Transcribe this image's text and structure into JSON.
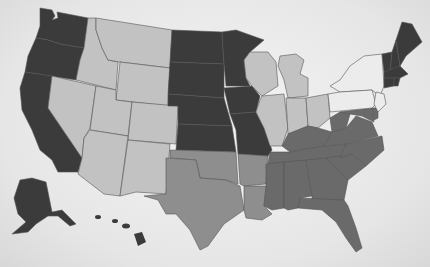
{
  "map": {
    "title": "United States map",
    "legend_colors": {
      "dark": "#3b3b3b",
      "light": "#c2c2c2",
      "medium": "#8e8e8e",
      "southeast": "#6a6a6a",
      "pale": "#ececec"
    },
    "states": [
      {
        "name": "Washington",
        "shade": "dark"
      },
      {
        "name": "Oregon",
        "shade": "dark"
      },
      {
        "name": "California",
        "shade": "dark"
      },
      {
        "name": "Idaho",
        "shade": "light"
      },
      {
        "name": "Nevada",
        "shade": "light"
      },
      {
        "name": "Montana",
        "shade": "light"
      },
      {
        "name": "Wyoming",
        "shade": "light"
      },
      {
        "name": "Utah",
        "shade": "light"
      },
      {
        "name": "Colorado",
        "shade": "light"
      },
      {
        "name": "Arizona",
        "shade": "light"
      },
      {
        "name": "New Mexico",
        "shade": "light"
      },
      {
        "name": "North Dakota",
        "shade": "dark"
      },
      {
        "name": "South Dakota",
        "shade": "dark"
      },
      {
        "name": "Nebraska",
        "shade": "dark"
      },
      {
        "name": "Kansas",
        "shade": "dark"
      },
      {
        "name": "Minnesota",
        "shade": "dark"
      },
      {
        "name": "Iowa",
        "shade": "dark"
      },
      {
        "name": "Missouri",
        "shade": "dark"
      },
      {
        "name": "Oklahoma",
        "shade": "medium"
      },
      {
        "name": "Texas",
        "shade": "medium"
      },
      {
        "name": "Arkansas",
        "shade": "medium"
      },
      {
        "name": "Louisiana",
        "shade": "medium"
      },
      {
        "name": "Wisconsin",
        "shade": "light"
      },
      {
        "name": "Michigan",
        "shade": "light"
      },
      {
        "name": "Illinois",
        "shade": "light"
      },
      {
        "name": "Indiana",
        "shade": "light"
      },
      {
        "name": "Ohio",
        "shade": "light"
      },
      {
        "name": "Kentucky",
        "shade": "southeast"
      },
      {
        "name": "Tennessee",
        "shade": "southeast"
      },
      {
        "name": "Mississippi",
        "shade": "southeast"
      },
      {
        "name": "Alabama",
        "shade": "southeast"
      },
      {
        "name": "Georgia",
        "shade": "southeast"
      },
      {
        "name": "Florida",
        "shade": "southeast"
      },
      {
        "name": "South Carolina",
        "shade": "southeast"
      },
      {
        "name": "North Carolina",
        "shade": "southeast"
      },
      {
        "name": "Virginia",
        "shade": "southeast"
      },
      {
        "name": "West Virginia",
        "shade": "southeast"
      },
      {
        "name": "Maryland",
        "shade": "southeast"
      },
      {
        "name": "Delaware",
        "shade": "southeast"
      },
      {
        "name": "New York",
        "shade": "pale"
      },
      {
        "name": "Pennsylvania",
        "shade": "pale"
      },
      {
        "name": "New Jersey",
        "shade": "pale"
      },
      {
        "name": "Maine",
        "shade": "dark"
      },
      {
        "name": "Vermont",
        "shade": "dark"
      },
      {
        "name": "New Hampshire",
        "shade": "dark"
      },
      {
        "name": "Massachusetts",
        "shade": "dark"
      },
      {
        "name": "Connecticut",
        "shade": "dark"
      },
      {
        "name": "Rhode Island",
        "shade": "dark"
      },
      {
        "name": "Alaska",
        "shade": "dark"
      },
      {
        "name": "Hawaii",
        "shade": "dark"
      }
    ]
  }
}
